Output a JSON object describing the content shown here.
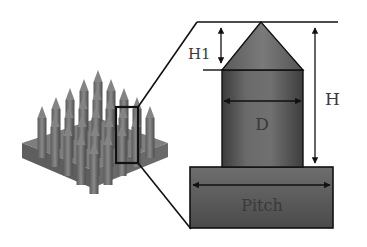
{
  "diagram": {
    "title": "",
    "labels": {
      "h1": "H1",
      "h": "H",
      "d": "D",
      "pitch": "Pitch"
    },
    "colors": {
      "background": "#ffffff",
      "line": "#111111",
      "structure_dark": "#4a4a4a",
      "structure_mid": "#6e6e6e",
      "structure_light": "#8a8a8a",
      "label_text": "#3a3a3a"
    },
    "components": [
      {
        "name": "nanopillar-array",
        "description": "3D array of cone-tipped cylindrical pillars on square substrate"
      },
      {
        "name": "selection-box",
        "description": "highlighted single pillar"
      },
      {
        "name": "pillar-detail",
        "parts": [
          "cone-tip",
          "cylinder-body",
          "base-block"
        ]
      }
    ]
  }
}
